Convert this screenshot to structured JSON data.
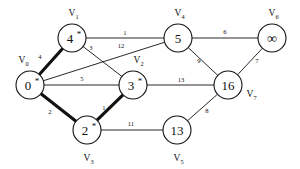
{
  "figure": {
    "background_color": "#ffffff",
    "line_color": "#111111"
  },
  "chart_data": {
    "type": "diagram",
    "subtype": "weighted-graph",
    "title": "",
    "nodes": [
      {
        "id": "V0",
        "name": "V",
        "subscript": "0",
        "value": "0",
        "finalized": true,
        "marker": "*",
        "x": 30,
        "y": 85,
        "r": 14,
        "label_x": 22,
        "label_y": 63
      },
      {
        "id": "V1",
        "name": "V",
        "subscript": "1",
        "value": "4",
        "finalized": true,
        "marker": "*",
        "x": 72,
        "y": 38,
        "r": 14,
        "label_x": 72,
        "label_y": 16
      },
      {
        "id": "V2",
        "name": "V",
        "subscript": "2",
        "value": "3",
        "finalized": true,
        "marker": "*",
        "x": 133,
        "y": 85,
        "r": 14,
        "label_x": 137,
        "label_y": 63
      },
      {
        "id": "V3",
        "name": "V",
        "subscript": "3",
        "value": "2",
        "finalized": true,
        "marker": "*",
        "x": 87,
        "y": 130,
        "r": 14,
        "label_x": 87,
        "label_y": 161
      },
      {
        "id": "V4",
        "name": "V",
        "subscript": "4",
        "value": "5",
        "finalized": false,
        "marker": "",
        "x": 178,
        "y": 38,
        "r": 14,
        "label_x": 178,
        "label_y": 16
      },
      {
        "id": "V5",
        "name": "V",
        "subscript": "5",
        "value": "13",
        "finalized": false,
        "marker": "",
        "x": 177,
        "y": 130,
        "r": 14,
        "label_x": 177,
        "label_y": 161
      },
      {
        "id": "V6",
        "name": "V",
        "subscript": "6",
        "value": "∞",
        "finalized": false,
        "marker": "",
        "x": 272,
        "y": 38,
        "r": 14,
        "label_x": 272,
        "label_y": 16
      },
      {
        "id": "V7",
        "name": "V",
        "subscript": "7",
        "value": "16",
        "finalized": false,
        "marker": "",
        "x": 228,
        "y": 85,
        "r": 14,
        "label_x": 250,
        "label_y": 97
      }
    ],
    "edges": [
      {
        "from": "V0",
        "to": "V1",
        "weight": "4",
        "highlighted": true,
        "label_x": 40,
        "label_y": 59
      },
      {
        "from": "V0",
        "to": "V2",
        "weight": "5",
        "highlighted": false,
        "label_x": 82,
        "label_y": 81
      },
      {
        "from": "V0",
        "to": "V3",
        "weight": "2",
        "highlighted": true,
        "label_x": 50,
        "label_y": 114
      },
      {
        "from": "V0",
        "to": "V4",
        "weight": "12",
        "highlighted": false,
        "label_x": 121,
        "label_y": 48
      },
      {
        "from": "V1",
        "to": "V4",
        "weight": "1",
        "highlighted": false,
        "label_x": 125,
        "label_y": 35
      },
      {
        "from": "V1",
        "to": "V2",
        "weight": "3",
        "highlighted": false,
        "label_x": 91,
        "label_y": 50
      },
      {
        "from": "V2",
        "to": "V3",
        "weight": "1",
        "highlighted": true,
        "label_x": 104,
        "label_y": 110
      },
      {
        "from": "V2",
        "to": "V7",
        "weight": "13",
        "highlighted": false,
        "label_x": 181,
        "label_y": 82
      },
      {
        "from": "V3",
        "to": "V5",
        "weight": "11",
        "highlighted": false,
        "label_x": 131,
        "label_y": 126
      },
      {
        "from": "V4",
        "to": "V6",
        "weight": "6",
        "highlighted": false,
        "label_x": 225,
        "label_y": 34
      },
      {
        "from": "V4",
        "to": "V7",
        "weight": "9",
        "highlighted": false,
        "label_x": 199,
        "label_y": 63
      },
      {
        "from": "V5",
        "to": "V7",
        "weight": "8",
        "highlighted": false,
        "label_x": 207,
        "label_y": 113
      },
      {
        "from": "V6",
        "to": "V7",
        "weight": "7",
        "highlighted": false,
        "label_x": 257,
        "label_y": 63
      }
    ]
  }
}
